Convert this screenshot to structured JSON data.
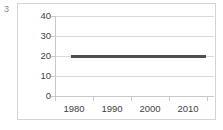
{
  "figure": {
    "index_label": "3",
    "background_color": "#ffffff",
    "frame_color": "#d4d4d4"
  },
  "chart_data": {
    "type": "line",
    "title": "",
    "subtitle": "",
    "xlabel": "",
    "ylabel": "",
    "grid": true,
    "legend": false,
    "legend_position": "none",
    "xlim": [
      1975,
      2017
    ],
    "ylim": [
      0,
      40
    ],
    "y_ticks": [
      0,
      10,
      20,
      30,
      40
    ],
    "y_tick_labels": [
      "0",
      "10",
      "20",
      "30",
      "40"
    ],
    "x_ticks": [
      1980,
      1990,
      2000,
      2010
    ],
    "x_tick_labels": [
      "1980",
      "1990",
      "2000",
      "2010"
    ],
    "series": [
      {
        "name": "",
        "color": "#4f4f4f",
        "x": [
          1979,
          1985,
          1990,
          1995,
          2000,
          2005,
          2010,
          2015
        ],
        "values": [
          20,
          20,
          20,
          20,
          20,
          20,
          20,
          20
        ],
        "constant_value": 20,
        "x_start": 1979,
        "x_end": 2015
      }
    ]
  },
  "axis": {
    "y_labels": [
      "40",
      "30",
      "20",
      "10",
      "0"
    ],
    "x_labels": [
      "1980",
      "1990",
      "2000",
      "2010"
    ]
  }
}
